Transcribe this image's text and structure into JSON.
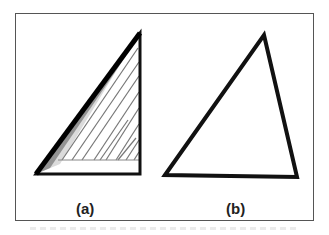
{
  "figure": {
    "panels": [
      {
        "id": "a",
        "label": "(a)",
        "description": "right triangle with shaded/hatched fill strokes"
      },
      {
        "id": "b",
        "label": "(b)",
        "description": "outline triangle"
      }
    ],
    "colors": {
      "stroke": "#111111",
      "hatch": "#777777",
      "border": "#555555",
      "background": "#ffffff"
    }
  }
}
